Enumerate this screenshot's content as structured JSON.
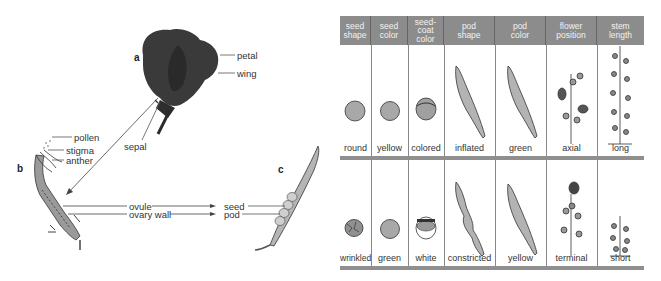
{
  "diagram": {
    "panels": {
      "a": {
        "letter": "a",
        "labels": {
          "petal": "petal",
          "wing": "wing",
          "sepal": "sepal"
        }
      },
      "b": {
        "letter": "b",
        "labels": {
          "pollen": "pollen",
          "stigma": "stigma",
          "anther": "anther",
          "ovule": "ovule",
          "ovary_wall": "ovary wall"
        }
      },
      "c": {
        "letter": "c",
        "labels": {
          "seed": "seed",
          "pod": "pod"
        }
      }
    },
    "colors": {
      "header_bg": "#8c8c8c",
      "header_text": "#f2f2f2",
      "divider": "#8f8f8f",
      "flower": "#3a3a3a",
      "pod": "#b5b5b5"
    }
  },
  "trait_table": {
    "columns": [
      {
        "header": [
          "seed",
          "shape"
        ],
        "dominant": "round",
        "recessive": "wrinkled"
      },
      {
        "header": [
          "seed",
          "color"
        ],
        "dominant": "yellow",
        "recessive": "green"
      },
      {
        "header": [
          "seed-",
          "coat",
          "color"
        ],
        "dominant": "colored",
        "recessive": "white"
      },
      {
        "header": [
          "pod",
          "shape"
        ],
        "dominant": "inflated",
        "recessive": "constricted"
      },
      {
        "header": [
          "pod",
          "color"
        ],
        "dominant": "green",
        "recessive": "yellow"
      },
      {
        "header": [
          "flower",
          "position"
        ],
        "dominant": "axial",
        "recessive": "terminal"
      },
      {
        "header": [
          "stem",
          "length"
        ],
        "dominant": "long",
        "recessive": "short"
      }
    ]
  }
}
